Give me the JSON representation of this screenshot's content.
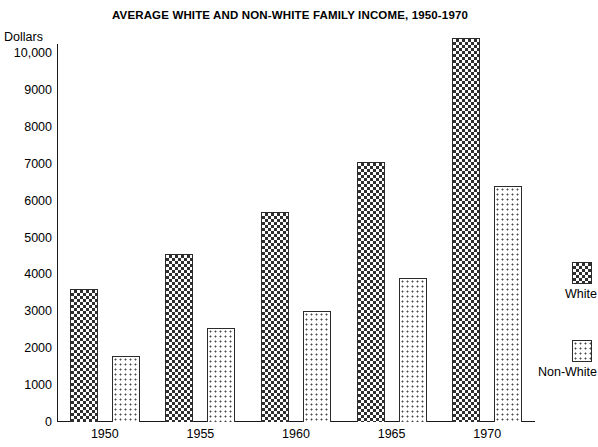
{
  "chart_data": {
    "type": "bar",
    "title": "AVERAGE WHITE AND NON-WHITE FAMILY INCOME, 1950-1970",
    "xlabel": "",
    "ylabel": "Dollars",
    "ylim": [
      0,
      10000
    ],
    "grid": false,
    "legend_position": "right",
    "categories": [
      "1950",
      "1955",
      "1960",
      "1965",
      "1970"
    ],
    "y_ticks": [
      0,
      1000,
      2000,
      3000,
      4000,
      5000,
      6000,
      7000,
      8000,
      9000,
      10000
    ],
    "y_tick_labels": [
      "0",
      "1000",
      "2000",
      "3000",
      "4000",
      "5000",
      "6000",
      "7000",
      "8000",
      "9000",
      "10,000"
    ],
    "series": [
      {
        "name": "White",
        "pattern": "dark-checkerboard",
        "values": [
          3600,
          4550,
          5700,
          7050,
          10400
        ]
      },
      {
        "name": "Non-White",
        "pattern": "light-dotted",
        "values": [
          1800,
          2550,
          3000,
          3900,
          6400
        ]
      }
    ]
  },
  "legend": {
    "entries": [
      {
        "label": "White"
      },
      {
        "label": "Non-White"
      }
    ]
  },
  "colors": {
    "axis": "#1a1a1a",
    "white_series": "#2e2e2e",
    "nonwhite_series": "#4a4a4a",
    "background": "#ffffff"
  }
}
